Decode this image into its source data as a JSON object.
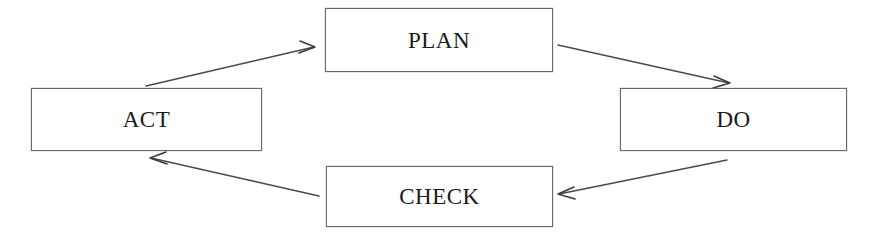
{
  "diagram": {
    "type": "cycle-flow-diagram",
    "background_color": "#ffffff",
    "border_color": "#6a6a6a",
    "text_color": "#1b1b1b",
    "nodes": [
      {
        "id": "plan",
        "label": "PLAN"
      },
      {
        "id": "do",
        "label": "DO"
      },
      {
        "id": "check",
        "label": "CHECK"
      },
      {
        "id": "act",
        "label": "ACT"
      }
    ],
    "edges": [
      {
        "id": "act-to-plan",
        "from": "ACT",
        "to": "PLAN",
        "direction": "up-right"
      },
      {
        "id": "plan-to-do",
        "from": "PLAN",
        "to": "DO",
        "direction": "down-right"
      },
      {
        "id": "do-to-check",
        "from": "DO",
        "to": "CHECK",
        "direction": "down-left"
      },
      {
        "id": "check-to-act",
        "from": "CHECK",
        "to": "ACT",
        "direction": "up-left"
      }
    ]
  }
}
